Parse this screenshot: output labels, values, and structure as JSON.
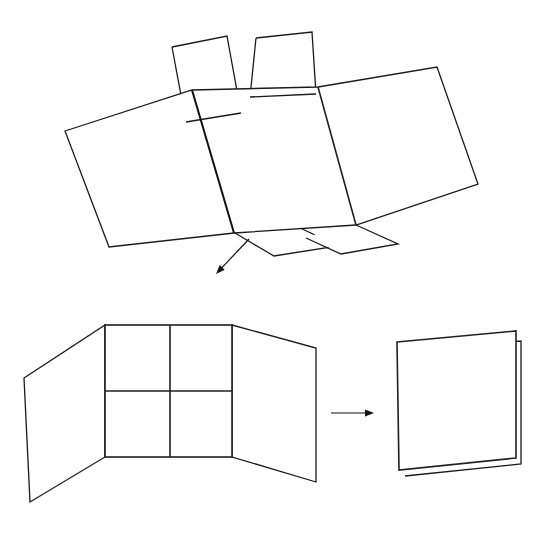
{
  "figure": {
    "background_color": "#ffffff",
    "line_color": "#1a1a1a",
    "width": 553,
    "height": 536,
    "labels": [],
    "steps": [
      {
        "name": "unfolded-box-net",
        "caption": ""
      },
      {
        "name": "partially-folded-panels",
        "caption": ""
      },
      {
        "name": "fully-folded-flat-stack",
        "caption": ""
      }
    ]
  },
  "shapes": {
    "top_net": {
      "name": "box-net-top",
      "main_body_outline": "65,131 192,90 318,87 437,67 478,184 356,225 234,233 109,247",
      "panels": [
        {
          "name": "net-panel-left",
          "points": "65,131 192,90 234,233 109,247"
        },
        {
          "name": "net-panel-center",
          "points": "192,90 318,87 356,225 234,233"
        },
        {
          "name": "net-panel-right",
          "points": "318,87 437,67 478,184 356,225"
        }
      ],
      "top_flaps": [
        {
          "name": "net-top-flap-left",
          "points": "172,47 227,36 241,113 186,122"
        },
        {
          "name": "net-top-flap-right",
          "points": "256,38 312,32 315,93 250,96"
        }
      ],
      "bottom_flaps": [
        {
          "name": "net-bottom-flap-left",
          "points": "234,233 295,226 337,246 274,256"
        },
        {
          "name": "net-bottom-flap-right",
          "points": "305,237 356,225 397,243 341,253"
        }
      ]
    },
    "mid_folded": {
      "name": "partially-folded-box",
      "left_wing": "24,378 105,325 105,457 30,502",
      "center_grid": "105,325 232,325 232,457 105,457",
      "center_divider_vertical": "170,325 170,457",
      "center_divider_horizontal": "105,391 232,391",
      "right_wing": "232,325 316,348 316,482 232,457"
    },
    "final_folded": {
      "name": "fully-folded-flat-panel",
      "front_face": "397,342 516,331 516,458 399,470",
      "back_layer_top": "403,352 521,341",
      "back_layer_right": "521,341 521,464",
      "back_layer_bottom": "521,464 510,466"
    },
    "arrows": [
      {
        "name": "arrow-net-to-folded",
        "from_x": 249,
        "from_y": 239,
        "to_x": 216,
        "to_y": 274,
        "direction": "down-left"
      },
      {
        "name": "arrow-folded-to-final",
        "from_x": 331,
        "from_y": 413,
        "to_x": 374,
        "to_y": 413,
        "direction": "right"
      }
    ]
  }
}
